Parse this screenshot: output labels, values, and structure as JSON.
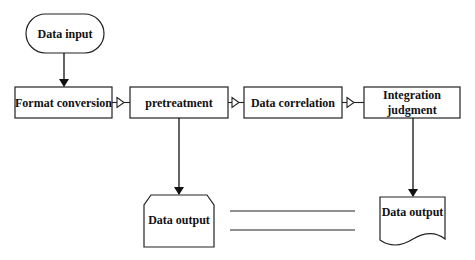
{
  "diagram": {
    "type": "flowchart",
    "nodes": {
      "data_input": {
        "label": "Data input",
        "shape": "terminator"
      },
      "format_conversion": {
        "label": "Format conversion",
        "shape": "process"
      },
      "pretreatment": {
        "label": "pretreatment",
        "shape": "process"
      },
      "data_correlation": {
        "label": "Data correlation",
        "shape": "process"
      },
      "integration_judgment": {
        "label": "Integration judgment",
        "shape": "process"
      },
      "data_output_left": {
        "label": "Data output",
        "shape": "chamfered-box"
      },
      "data_output_right": {
        "label": "Data output",
        "shape": "document"
      }
    },
    "edges": [
      {
        "from": "data_input",
        "to": "format_conversion",
        "style": "solid-arrow"
      },
      {
        "from": "format_conversion",
        "to": "pretreatment",
        "style": "hollow-triangle"
      },
      {
        "from": "pretreatment",
        "to": "data_correlation",
        "style": "hollow-triangle"
      },
      {
        "from": "data_correlation",
        "to": "integration_judgment",
        "style": "hollow-triangle"
      },
      {
        "from": "pretreatment",
        "to": "data_output_left",
        "style": "solid-arrow"
      },
      {
        "from": "integration_judgment",
        "to": "data_output_right",
        "style": "solid-arrow"
      }
    ],
    "decoration": "two parallel horizontal lines between outputs",
    "colors": {
      "stroke": "#222222",
      "background": "#ffffff",
      "text": "#111111"
    }
  }
}
